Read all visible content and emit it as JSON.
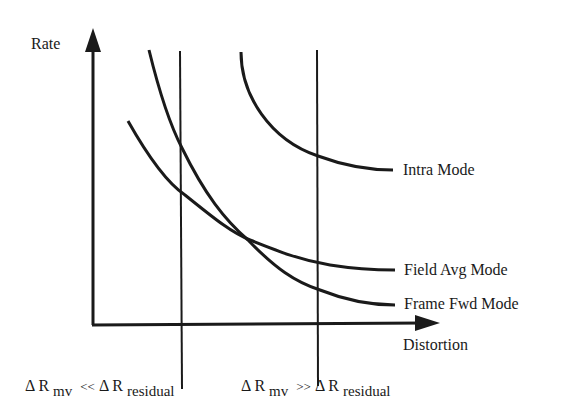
{
  "diagram": {
    "y_axis_label": "Rate",
    "x_axis_label": "Distortion",
    "curves": [
      {
        "name": "Intra Mode",
        "label": "Intra Mode"
      },
      {
        "name": "Field Avg Mode",
        "label": "Field Avg Mode"
      },
      {
        "name": "Frame Fwd Mode",
        "label": "Frame Fwd Mode"
      }
    ],
    "regions": [
      {
        "delta": "Δ",
        "lhs": "R",
        "lhs_sub": "mv",
        "op": "<<",
        "rhs_delta": "Δ",
        "rhs": "R",
        "rhs_sub": "residual"
      },
      {
        "delta": "Δ",
        "lhs": "R",
        "lhs_sub": "mv",
        "op": ">>",
        "rhs_delta": "Δ",
        "rhs": "R",
        "rhs_sub": "residual"
      }
    ],
    "stroke_color": "#1a1a1a",
    "background": "#ffffff"
  }
}
